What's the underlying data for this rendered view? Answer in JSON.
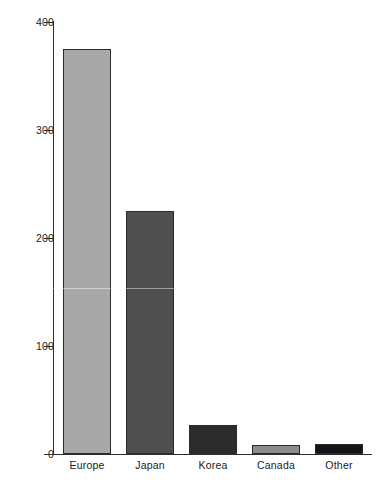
{
  "chart_data": {
    "type": "bar",
    "title": "",
    "xlabel": "",
    "ylabel": "",
    "categories": [
      "Europe",
      "Japan",
      "Korea",
      "Canada",
      "Other"
    ],
    "values": [
      375,
      225,
      27,
      8,
      9
    ],
    "ylim": [
      0,
      400
    ],
    "yticks": [
      0,
      100,
      200,
      300,
      400
    ],
    "ytick_labels": [
      "0",
      "100",
      "200",
      "300",
      "400"
    ],
    "grid": false,
    "legend": "none",
    "bar_colors": [
      "#a8a8a8",
      "#4f4f4f",
      "#2b2b2b",
      "#8c8c8c",
      "#141414"
    ],
    "bar_edge_color": "#2b2b2b",
    "axis_color": "#2e2e2e",
    "background_color": "#ffffff"
  },
  "axis": {
    "y_tick_0": "0",
    "y_tick_1": "100",
    "y_tick_2": "200",
    "y_tick_3": "300",
    "y_tick_4": "400"
  },
  "labels": {
    "cat_0": "Europe",
    "cat_1": "Japan",
    "cat_2": "Korea",
    "cat_3": "Canada",
    "cat_4": "Other"
  }
}
